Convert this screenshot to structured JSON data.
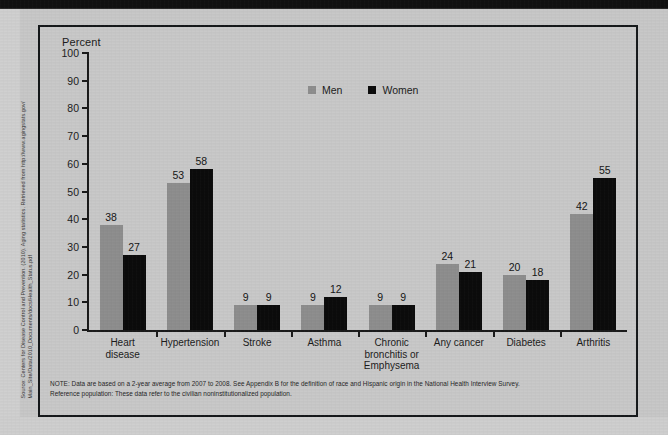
{
  "source_credit": "Source: Centers for Disease Control and Prevention. (2010). Aging statistics. Retrieved from http://www.agingstats.gov/\nMain_Site/Data/2010_Documents/docs/Health_Status.pdf",
  "note": {
    "line1": "NOTE: Data are based on a 2-year average from 2007 to 2008. See Appendix B for the definition of race and Hispanic origin in the National Health Interview Survey.",
    "line2": "Reference population: These data refer to the civilian noninstitutionalized population."
  },
  "colors": {
    "men": "#8e8e8e",
    "women": "#0c0c0c",
    "axis": "#1a1a1a",
    "background": "#c9c9c9",
    "page": "#c8c8c8"
  },
  "chart_data": {
    "type": "bar",
    "title": "",
    "subtitle": "",
    "xlabel": "",
    "ylabel": "Percent",
    "ylim": [
      0,
      100
    ],
    "yticks": [
      0,
      10,
      20,
      30,
      40,
      50,
      60,
      70,
      80,
      90,
      100
    ],
    "grid": false,
    "legend_position": "top-center",
    "categories": [
      "Heart\ndisease",
      "Hypertension",
      "Stroke",
      "Asthma",
      "Chronic\nbronchitis or\nEmphysema",
      "Any cancer",
      "Diabetes",
      "Arthritis"
    ],
    "series": [
      {
        "name": "Men",
        "color": "#8e8e8e",
        "values": [
          38,
          53,
          9,
          9,
          9,
          24,
          20,
          42
        ]
      },
      {
        "name": "Women",
        "color": "#0c0c0c",
        "values": [
          27,
          58,
          9,
          12,
          9,
          21,
          18,
          55
        ]
      }
    ]
  }
}
